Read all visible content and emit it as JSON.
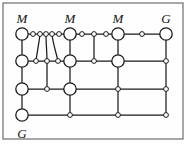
{
  "figure": {
    "border": {
      "color": "#6d6d6d",
      "fill": "#fefefe",
      "x": 3,
      "y": 3,
      "width": 180,
      "height": 136
    },
    "style": {
      "edge_color": "#1a1a1a",
      "node_stroke": "#1a1a1a",
      "node_fill": "#ffffff",
      "large_node_radius": 6.2,
      "small_node_radius": 2.4,
      "edge_width": 1.25
    },
    "labels": [
      {
        "name": "label-M-1",
        "text": "M",
        "x": 22,
        "y": 23
      },
      {
        "name": "label-M-2",
        "text": "M",
        "x": 70,
        "y": 23
      },
      {
        "name": "label-M-3",
        "text": "M",
        "x": 118,
        "y": 23
      },
      {
        "name": "label-G-top",
        "text": "G",
        "x": 166,
        "y": 23
      },
      {
        "name": "label-G-bottom",
        "text": "G",
        "x": 22,
        "y": 138
      }
    ],
    "rows": {
      "r1": 34,
      "r2": 61,
      "r3": 89,
      "r4": 115
    },
    "columns": {
      "c1": 22,
      "c2": 70,
      "c3": 118,
      "c4": 166
    },
    "nodes": [
      {
        "name": "node-M1",
        "id": "n_c1r1",
        "x": 22,
        "y": 34,
        "size": "large",
        "label": "M"
      },
      {
        "name": "node-M2",
        "id": "n_c2r1",
        "x": 70,
        "y": 34,
        "size": "large",
        "label": "M"
      },
      {
        "name": "node-M3",
        "id": "n_c3r1",
        "x": 118,
        "y": 34,
        "size": "large",
        "label": "M"
      },
      {
        "name": "node-G-top-right",
        "id": "n_c4r1",
        "x": 166,
        "y": 34,
        "size": "large",
        "label": "G"
      },
      {
        "name": "node-r1-a",
        "id": "n_r1a",
        "x": 33,
        "y": 34,
        "size": "small",
        "label": ""
      },
      {
        "name": "node-r1-b",
        "id": "n_r1b",
        "x": 40,
        "y": 34,
        "size": "small",
        "label": ""
      },
      {
        "name": "node-r1-c",
        "id": "n_r1c",
        "x": 46,
        "y": 34,
        "size": "small",
        "label": ""
      },
      {
        "name": "node-r1-d",
        "id": "n_r1d",
        "x": 52,
        "y": 34,
        "size": "small",
        "label": ""
      },
      {
        "name": "node-r1-e",
        "id": "n_r1e",
        "x": 59,
        "y": 34,
        "size": "small",
        "label": ""
      },
      {
        "name": "node-r1-f",
        "id": "n_r1f",
        "x": 82,
        "y": 34,
        "size": "small",
        "label": ""
      },
      {
        "name": "node-r1-g",
        "id": "n_r1g",
        "x": 94,
        "y": 34,
        "size": "small",
        "label": ""
      },
      {
        "name": "node-r1-h",
        "id": "n_r1h",
        "x": 106,
        "y": 34,
        "size": "small",
        "label": ""
      },
      {
        "name": "node-r1-i",
        "id": "n_r1i",
        "x": 142,
        "y": 34,
        "size": "small",
        "label": ""
      },
      {
        "name": "node-r2-c1",
        "id": "n_c1r2",
        "x": 22,
        "y": 61,
        "size": "large",
        "label": ""
      },
      {
        "name": "node-r2-a",
        "id": "n_r2a",
        "x": 36,
        "y": 61,
        "size": "small",
        "label": ""
      },
      {
        "name": "node-r2-b",
        "id": "n_r2b",
        "x": 47,
        "y": 61,
        "size": "small",
        "label": ""
      },
      {
        "name": "node-r2-c",
        "id": "n_r2c",
        "x": 58,
        "y": 61,
        "size": "small",
        "label": ""
      },
      {
        "name": "node-r2-c2",
        "id": "n_c2r2",
        "x": 70,
        "y": 61,
        "size": "large",
        "label": ""
      },
      {
        "name": "node-r2-d",
        "id": "n_r2d",
        "x": 94,
        "y": 61,
        "size": "small",
        "label": ""
      },
      {
        "name": "node-r2-c3",
        "id": "n_c3r2",
        "x": 118,
        "y": 61,
        "size": "large",
        "label": ""
      },
      {
        "name": "node-r2-c4",
        "id": "n_c4r2",
        "x": 166,
        "y": 61,
        "size": "small",
        "label": ""
      },
      {
        "name": "node-r3-c1",
        "id": "n_c1r3",
        "x": 22,
        "y": 89,
        "size": "large",
        "label": ""
      },
      {
        "name": "node-r3-a",
        "id": "n_r3a",
        "x": 47,
        "y": 89,
        "size": "small",
        "label": ""
      },
      {
        "name": "node-r3-c2",
        "id": "n_c2r3",
        "x": 70,
        "y": 89,
        "size": "large",
        "label": ""
      },
      {
        "name": "node-r3-c3",
        "id": "n_c3r3",
        "x": 118,
        "y": 89,
        "size": "small",
        "label": ""
      },
      {
        "name": "node-r3-c4",
        "id": "n_c4r3",
        "x": 166,
        "y": 89,
        "size": "small",
        "label": ""
      },
      {
        "name": "node-G-bottom-left",
        "id": "n_c1r4",
        "x": 22,
        "y": 115,
        "size": "large",
        "label": "G"
      },
      {
        "name": "node-r4-c2",
        "id": "n_c2r4",
        "x": 70,
        "y": 115,
        "size": "small",
        "label": ""
      },
      {
        "name": "node-r4-c3",
        "id": "n_c3r4",
        "x": 118,
        "y": 115,
        "size": "small",
        "label": ""
      },
      {
        "name": "node-r4-c4",
        "id": "n_c4r4",
        "x": 166,
        "y": 115,
        "size": "small",
        "label": ""
      }
    ],
    "edges": [
      {
        "name": "edge-r1-horizontal",
        "from": "n_c1r1",
        "to": "n_c4r1",
        "path": "M 22 34 L 166 34"
      },
      {
        "name": "edge-r2-horizontal",
        "from": "n_c1r2",
        "to": "n_c4r2",
        "path": "M 22 61 L 166 61"
      },
      {
        "name": "edge-r3-horizontal",
        "from": "n_c1r3",
        "to": "n_c4r3",
        "path": "M 22 89 L 166 89"
      },
      {
        "name": "edge-r4-horizontal",
        "from": "n_c1r4",
        "to": "n_c4r4",
        "path": "M 22 115 L 166 115"
      },
      {
        "name": "edge-c1-vertical",
        "from": "n_c1r1",
        "to": "n_c1r4",
        "path": "M 22 34 L 22 115"
      },
      {
        "name": "edge-c2-vertical",
        "from": "n_c2r1",
        "to": "n_c2r4",
        "path": "M 70 34 L 70 115"
      },
      {
        "name": "edge-c3-vertical",
        "from": "n_c3r1",
        "to": "n_c3r4",
        "path": "M 118 34 L 118 115"
      },
      {
        "name": "edge-c4-vertical",
        "from": "n_c4r1",
        "to": "n_c4r4",
        "path": "M 166 34 L 166 115"
      },
      {
        "name": "edge-fan-a",
        "from": "n_r1b",
        "to": "n_r2a",
        "path": "M 40 34 C 39 44 37 52 36 61"
      },
      {
        "name": "edge-fan-b",
        "from": "n_r1c",
        "to": "n_r2b",
        "path": "M 46 34 C 46 44 47 52 47 61"
      },
      {
        "name": "edge-fan-c",
        "from": "n_r1d",
        "to": "n_r2c",
        "path": "M 52 34 C 53 44 56 52 58 61"
      },
      {
        "name": "edge-r2b-r3a",
        "from": "n_r2b",
        "to": "n_r3a",
        "path": "M 47 61 L 47 89"
      },
      {
        "name": "edge-r1g-r2d",
        "from": "n_r1g",
        "to": "n_r2d",
        "path": "M 94 34 L 94 61"
      }
    ]
  }
}
